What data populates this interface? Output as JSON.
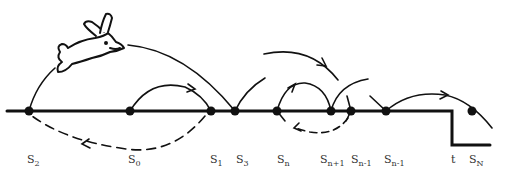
{
  "diagram": {
    "baseline_color": "#111111",
    "nodes": [
      {
        "id": "s2",
        "x": 29
      },
      {
        "id": "s0",
        "x": 130
      },
      {
        "id": "s1",
        "x": 211
      },
      {
        "id": "s3",
        "x": 235
      },
      {
        "id": "sn",
        "x": 277
      },
      {
        "id": "sn+1",
        "x": 331
      },
      {
        "id": "sn-1a",
        "x": 351
      },
      {
        "id": "sn-1b",
        "x": 386
      },
      {
        "id": "sN",
        "x": 472,
        "y": 111
      }
    ],
    "labels": [
      {
        "base": "S",
        "sub": "2",
        "x": 27
      },
      {
        "base": "S",
        "sub": "0",
        "x": 128
      },
      {
        "base": "S",
        "sub": "1",
        "x": 210
      },
      {
        "base": "S",
        "sub": "3",
        "x": 236
      },
      {
        "base": "S",
        "sub": "n",
        "x": 277
      },
      {
        "base": "S",
        "sub": "n+1",
        "x": 320
      },
      {
        "base": "S",
        "sub": "n-1",
        "x": 351
      },
      {
        "base": "S",
        "sub": "n-1",
        "x": 384
      },
      {
        "base": "t",
        "sub": "",
        "x": 451
      },
      {
        "base": "S",
        "sub": "N",
        "x": 469
      }
    ]
  }
}
